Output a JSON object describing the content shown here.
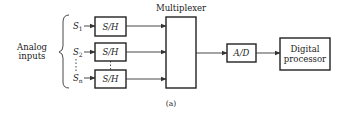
{
  "diagram": {
    "input_group_label_line1": "Analog",
    "input_group_label_line2": "inputs",
    "inputs": [
      {
        "symbol": "S",
        "subscript": "1",
        "block": "S/H"
      },
      {
        "symbol": "S",
        "subscript": "2",
        "block": "S/H"
      },
      {
        "symbol": "S",
        "subscript": "n",
        "block": "S/H"
      }
    ],
    "multiplexer_label": "Multiplexer",
    "converter_label": "A/D",
    "processor_label_line1": "Digital",
    "processor_label_line2": "processor",
    "caption": "(a)"
  }
}
